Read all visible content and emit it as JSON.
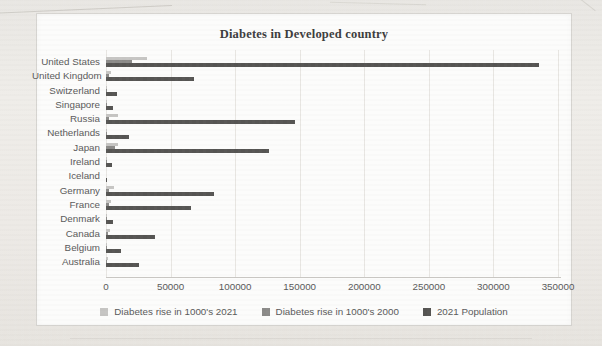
{
  "chart_data": {
    "type": "bar",
    "orientation": "horizontal",
    "title": "Diabetes in Developed country",
    "categories": [
      "United States",
      "United Kingdom",
      "Switzerland",
      "Singapore",
      "Russia",
      "Netherlands",
      "Japan",
      "Ireland",
      "Iceland",
      "Germany",
      "France",
      "Denmark",
      "Canada",
      "Belgium",
      "Australia"
    ],
    "series": [
      {
        "name": "Diabetes rise in 1000's 2021",
        "color": "#c6c5c3",
        "values": [
          32000,
          4200,
          500,
          1000,
          9000,
          1100,
          9000,
          300,
          30,
          6200,
          4000,
          300,
          3000,
          600,
          1800
        ]
      },
      {
        "name": "Diabetes rise in 1000's 2000",
        "color": "#8c8b89",
        "values": [
          20000,
          2500,
          300,
          600,
          2000,
          700,
          7000,
          200,
          15,
          2600,
          2000,
          200,
          1500,
          400,
          900
        ]
      },
      {
        "name": "2021 Population",
        "color": "#565553",
        "values": [
          335000,
          68000,
          8700,
          5700,
          146000,
          17500,
          126000,
          5000,
          370,
          83500,
          65500,
          5800,
          38000,
          11600,
          25700
        ]
      }
    ],
    "x_ticks": [
      0,
      50000,
      100000,
      150000,
      200000,
      250000,
      300000,
      350000
    ],
    "xlim": [
      0,
      350000
    ],
    "grid": true,
    "legend_position": "bottom"
  }
}
